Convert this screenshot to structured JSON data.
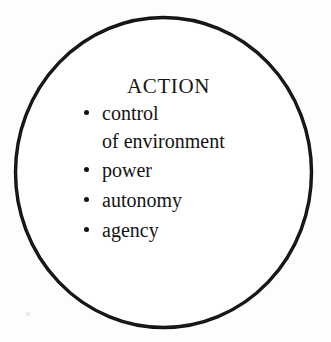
{
  "diagram": {
    "shape": "circle",
    "shape_name": "circle-outline",
    "stroke_color": "#101010",
    "stroke_width": 3.4,
    "fill_color": "#ffffff",
    "background_color": "#fdfdfd",
    "heading": "ACTION",
    "items": [
      {
        "bullet": "•",
        "label": "control",
        "continuation": "of environment"
      },
      {
        "bullet": "•",
        "label": "power",
        "continuation": ""
      },
      {
        "bullet": "•",
        "label": "autonomy",
        "continuation": ""
      },
      {
        "bullet": "•",
        "label": "agency",
        "continuation": ""
      }
    ]
  }
}
